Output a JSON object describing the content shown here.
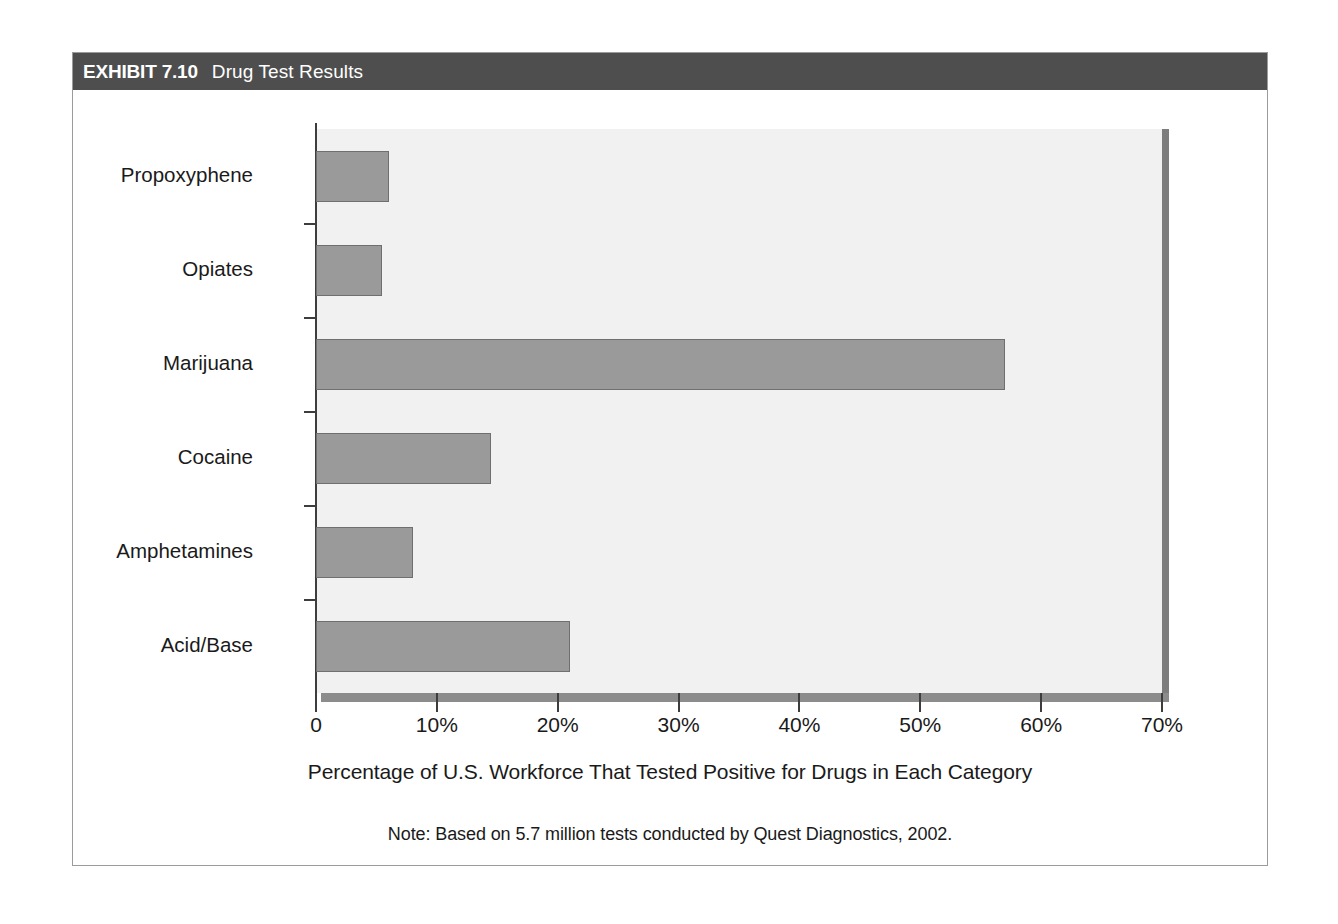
{
  "exhibit": {
    "number": "EXHIBIT 7.10",
    "title": "Drug Test Results"
  },
  "chart_data": {
    "type": "bar",
    "orientation": "horizontal",
    "title": "Drug Test Results",
    "categories": [
      "Propoxyphene",
      "Opiates",
      "Marijuana",
      "Cocaine",
      "Amphetamines",
      "Acid/Base"
    ],
    "values": [
      6,
      5.5,
      57,
      14.5,
      8,
      21
    ],
    "xlabel": "Percentage of U.S. Workforce That Tested Positive for Drugs in Each Category",
    "ylabel": "",
    "xlim": [
      0,
      70
    ],
    "xticks": [
      0,
      10,
      20,
      30,
      40,
      50,
      60,
      70
    ],
    "xtick_labels": [
      "0",
      "10%",
      "20%",
      "30%",
      "40%",
      "50%",
      "60%",
      "70%"
    ],
    "grid": false,
    "legend": "none",
    "note": "Note: Based on 5.7 million tests conducted by Quest Diagnostics, 2002.",
    "colors": {
      "bar_fill": "#9a9a9a",
      "bar_stroke": "#6f6f6f",
      "plot_background": "#f1f1f1",
      "axis": "#3d3d3d",
      "baseline": "#8c8c8c",
      "header_background": "#4e4e4e",
      "header_text": "#ffffff",
      "frame_border": "#9b9b9b",
      "text": "#1a1a1a"
    }
  }
}
